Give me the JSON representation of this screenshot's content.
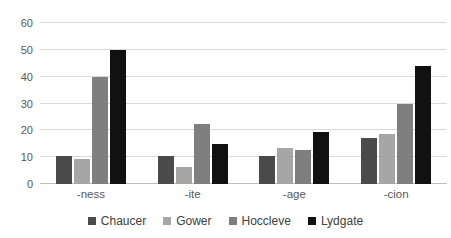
{
  "chart_data": {
    "type": "bar",
    "title": "",
    "categories": [
      "-ness",
      "-ite",
      "-age",
      "-cion"
    ],
    "series": [
      {
        "name": "Chaucer",
        "color": "#4a4a4a",
        "values": [
          10.5,
          10.5,
          10.5,
          17
        ]
      },
      {
        "name": "Gower",
        "color": "#a6a6a6",
        "values": [
          9.5,
          6.5,
          13.5,
          18.5
        ]
      },
      {
        "name": "Hoccleve",
        "color": "#7f7f7f",
        "values": [
          40,
          22.5,
          12.5,
          30
        ]
      },
      {
        "name": "Lydgate",
        "color": "#111111",
        "values": [
          50,
          15,
          19.5,
          44
        ]
      }
    ],
    "xlabel": "",
    "ylabel": "",
    "ylim": [
      0,
      60
    ],
    "ytick_step": 10,
    "ytick_labels": [
      "0",
      "10",
      "20",
      "30",
      "40",
      "50",
      "60"
    ],
    "grid": true,
    "legend_position": "bottom"
  },
  "colors": {
    "background": "#ffffff",
    "gridline": "#d9d9d9",
    "axis_line": "#bfbfbf",
    "tick_text": "#595959",
    "legend_text": "#404040"
  }
}
